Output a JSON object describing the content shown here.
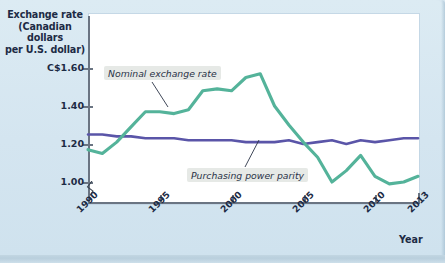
{
  "chart_data": {
    "type": "line",
    "title": "Exchange rate (Canadian dollars per U.S. dollar)",
    "title_lines": [
      "Exchange rate",
      "(Canadian dollars",
      "per U.S. dollar)"
    ],
    "xlabel": "Year",
    "ylabel": "Exchange rate (Canadian dollars per U.S. dollar)",
    "ylim": [
      0.93,
      1.66
    ],
    "xlim": [
      1990,
      2013
    ],
    "grid": false,
    "legend_position": "inline-annotations",
    "y_ticks": [
      {
        "value": 1.6,
        "label": "C$1.60"
      },
      {
        "value": 1.4,
        "label": "1.40"
      },
      {
        "value": 1.2,
        "label": "1.20"
      },
      {
        "value": 1.0,
        "label": "1.00"
      }
    ],
    "x_ticks": [
      {
        "value": 1990,
        "label": "1990"
      },
      {
        "value": 1995,
        "label": "1995"
      },
      {
        "value": 2000,
        "label": "2000"
      },
      {
        "value": 2005,
        "label": "2005"
      },
      {
        "value": 2010,
        "label": "2010"
      },
      {
        "value": 2013,
        "label": "2013"
      }
    ],
    "axis_break": true,
    "x": [
      1990,
      1991,
      1992,
      1993,
      1994,
      1995,
      1996,
      1997,
      1998,
      1999,
      2000,
      2001,
      2002,
      2003,
      2004,
      2005,
      2006,
      2007,
      2008,
      2009,
      2010,
      2011,
      2012,
      2013
    ],
    "series": [
      {
        "name": "Nominal exchange rate",
        "color": "#54b39a",
        "annotation": "Nominal exchange rate",
        "values": [
          1.17,
          1.15,
          1.21,
          1.29,
          1.37,
          1.37,
          1.36,
          1.38,
          1.48,
          1.49,
          1.48,
          1.55,
          1.57,
          1.4,
          1.3,
          1.21,
          1.13,
          1.0,
          1.06,
          1.14,
          1.03,
          0.99,
          1.0,
          1.03
        ]
      },
      {
        "name": "Purchasing power parity",
        "color": "#5a55a8",
        "annotation": "Purchasing power parity",
        "values": [
          1.25,
          1.25,
          1.24,
          1.24,
          1.23,
          1.23,
          1.23,
          1.22,
          1.22,
          1.22,
          1.22,
          1.21,
          1.21,
          1.21,
          1.22,
          1.2,
          1.21,
          1.22,
          1.2,
          1.22,
          1.21,
          1.22,
          1.23,
          1.23
        ]
      }
    ]
  },
  "axis": {
    "year_caption": "Year"
  }
}
